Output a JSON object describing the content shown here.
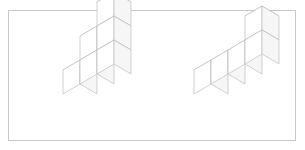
{
  "panel": {
    "background_color": "#ffffff",
    "border_color": "#c9c9c9",
    "page_background_color": "#ffffff"
  },
  "render": {
    "line_color": "#b3b3b3",
    "face_top_color": "#fdfdfd",
    "face_left_color": "#ffffff",
    "face_right_color": "#f6f6f6",
    "projection": "isometric",
    "cube_half_width": 17,
    "cube_rise": 10,
    "cube_height": 24
  },
  "figures": [
    {
      "name": "staircase-figure",
      "label": "",
      "cube_count": 6,
      "origin_x": 80,
      "origin_y": 104,
      "description": "three-step staircase of unit cubes",
      "cubes": [
        {
          "x": 0,
          "y": 0,
          "z": 0
        },
        {
          "x": 1,
          "y": 0,
          "z": 0
        },
        {
          "x": 2,
          "y": 0,
          "z": 0
        },
        {
          "x": 1,
          "y": 0,
          "z": 1
        },
        {
          "x": 2,
          "y": 0,
          "z": 1
        },
        {
          "x": 2,
          "y": 0,
          "z": 2
        }
      ]
    },
    {
      "name": "l-shape-figure",
      "label": "",
      "cube_count": 5,
      "origin_x": 211,
      "origin_y": 104,
      "description": "row of four unit cubes with one cube stacked on the far end",
      "cubes": [
        {
          "x": 0,
          "y": 0,
          "z": 0
        },
        {
          "x": 1,
          "y": 0,
          "z": 0
        },
        {
          "x": 2,
          "y": 0,
          "z": 0
        },
        {
          "x": 3,
          "y": 0,
          "z": 0
        },
        {
          "x": 3,
          "y": 0,
          "z": 1
        }
      ]
    }
  ]
}
